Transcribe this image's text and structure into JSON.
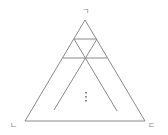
{
  "diagram": {
    "title": "",
    "vertex_labels": {
      "top": "ㄱ",
      "bottom_left": "ㄴ",
      "bottom_right": "ㄷ"
    },
    "ellipsis": "⋮",
    "colors": {
      "line": "#8a8a8a",
      "background": "#ffffff"
    }
  }
}
